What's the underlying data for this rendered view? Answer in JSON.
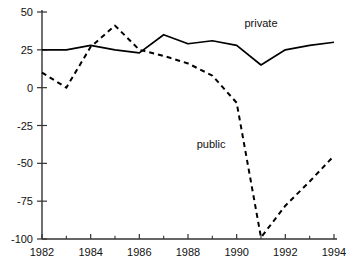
{
  "chart_data": {
    "type": "line",
    "title": "",
    "subtitle": "",
    "xlabel": "",
    "ylabel": "",
    "x": [
      1982,
      1983,
      1984,
      1985,
      1986,
      1987,
      1988,
      1989,
      1990,
      1991,
      1992,
      1993,
      1994
    ],
    "xlim": [
      1982,
      1994
    ],
    "ylim": [
      -100,
      50
    ],
    "yticks": [
      50,
      25,
      0,
      -25,
      -50,
      -75,
      -100
    ],
    "ytick_labels": [
      "50",
      "25",
      "0",
      "-25",
      "-50",
      "-75",
      "-100"
    ],
    "xticks_major": [
      1982,
      1984,
      1986,
      1988,
      1990,
      1992,
      1994
    ],
    "xtick_labels": [
      "1982",
      "1984",
      "1986",
      "1988",
      "1990",
      "1992",
      "1994"
    ],
    "xticks_minor": [
      1983,
      1985,
      1987,
      1989,
      1991,
      1993
    ],
    "grid": false,
    "legend_position": "inline-annotation",
    "series": [
      {
        "name": "private",
        "style": "solid",
        "color": "#000000",
        "label_text": "private",
        "label_x": 1991.0,
        "label_y": 40,
        "values": [
          25,
          25,
          28,
          25,
          23,
          35,
          29,
          31,
          28,
          15,
          25,
          28,
          30
        ]
      },
      {
        "name": "public",
        "style": "dashed",
        "color": "#000000",
        "label_text": "public",
        "label_x": 1988.95,
        "label_y": -40,
        "values": [
          10,
          0,
          27,
          41,
          25,
          21,
          16,
          8,
          -10,
          -99,
          -78,
          -62,
          -45
        ]
      }
    ],
    "annotations": [
      {
        "text": "private",
        "series": "private"
      },
      {
        "text": "public",
        "series": "public"
      }
    ]
  },
  "axes": {
    "axis_color": "#333333",
    "tick_length": 5
  }
}
